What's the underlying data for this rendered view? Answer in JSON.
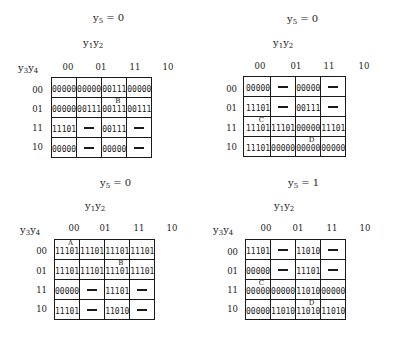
{
  "figure": {
    "column_labels": [
      "00",
      "01",
      "11",
      "10"
    ],
    "row_labels": [
      "00",
      "01",
      "11",
      "10"
    ],
    "column_variable": "y1y2",
    "row_variable": "y3y4",
    "dont_care_symbol": "—"
  },
  "maps": [
    {
      "title": "y5 = 0",
      "title_var": "y",
      "title_sub": "5",
      "title_rest": " = 0",
      "show_row_variable": true,
      "rows": [
        [
          "00000",
          "00000",
          "00111",
          "00000"
        ],
        [
          "00000",
          "00111",
          "00111",
          "00111"
        ],
        [
          "11101",
          "—",
          "00111",
          "—"
        ],
        [
          "00000",
          "—",
          "00000",
          "—"
        ]
      ],
      "marks": [
        {
          "row": 1,
          "col": 2,
          "label": "B"
        }
      ]
    },
    {
      "title": "y5 = 0",
      "title_var": "y",
      "title_sub": "5",
      "title_rest": " = 0",
      "show_row_variable": false,
      "rows": [
        [
          "00000",
          "—",
          "00000",
          "—"
        ],
        [
          "11101",
          "—",
          "00111",
          "—"
        ],
        [
          "11101",
          "11101",
          "00000",
          "11101"
        ],
        [
          "11101",
          "00000",
          "00000",
          "00000"
        ]
      ],
      "marks": [
        {
          "row": 2,
          "col": 0,
          "label": "C"
        },
        {
          "row": 3,
          "col": 2,
          "label": "D"
        }
      ]
    },
    {
      "title": "y5 = 0",
      "title_var": "y",
      "title_sub": "5",
      "title_rest": " = 0",
      "show_row_variable": true,
      "rows": [
        [
          "11101",
          "11101",
          "11101",
          "11101"
        ],
        [
          "11101",
          "11101",
          "11101",
          "11101"
        ],
        [
          "00000",
          "—",
          "11101",
          "—"
        ],
        [
          "11101",
          "—",
          "11010",
          "—"
        ]
      ],
      "marks": [
        {
          "row": 0,
          "col": 0,
          "label": "A"
        },
        {
          "row": 1,
          "col": 2,
          "label": "B"
        }
      ]
    },
    {
      "title": "y5 = 1",
      "title_var": "y",
      "title_sub": "5",
      "title_rest": " = 1",
      "show_row_variable": true,
      "rows": [
        [
          "11101",
          "—",
          "11010",
          "—"
        ],
        [
          "00000",
          "—",
          "11101",
          "—"
        ],
        [
          "00000",
          "00000",
          "11010",
          "00000"
        ],
        [
          "00000",
          "11010",
          "11010",
          "11010"
        ]
      ],
      "marks": [
        {
          "row": 2,
          "col": 0,
          "label": "C"
        },
        {
          "row": 3,
          "col": 2,
          "label": "D"
        }
      ]
    }
  ]
}
